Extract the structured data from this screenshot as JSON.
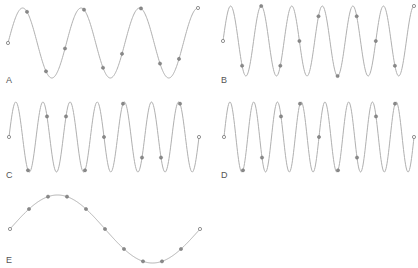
{
  "figure": {
    "colors": {
      "wave": "#b0b0b0",
      "sample": "#8a8a8a",
      "label": "#555555"
    },
    "panels": [
      {
        "label": "A",
        "x0": 8,
        "x1": 198,
        "cy": 43,
        "amp": 35,
        "cycles": 3.25,
        "samples": 11,
        "label_x": 6,
        "label_y": 83
      },
      {
        "label": "B",
        "x0": 223,
        "x1": 414,
        "cy": 41,
        "amp": 35,
        "cycles": 6.25,
        "samples": 11,
        "label_x": 221,
        "label_y": 83
      },
      {
        "label": "C",
        "x0": 9,
        "x1": 199,
        "cy": 137,
        "amp": 35,
        "cycles": 7.0,
        "samples": 11,
        "label_x": 6,
        "label_y": 178
      },
      {
        "label": "D",
        "x0": 224,
        "x1": 414,
        "cy": 137,
        "amp": 35,
        "cycles": 8.0,
        "samples": 11,
        "label_x": 221,
        "label_y": 178
      },
      {
        "label": "E",
        "x0": 10,
        "x1": 200,
        "cy": 229,
        "amp": 34,
        "cycles": 1.0,
        "samples": 11,
        "label_x": 6,
        "label_y": 263
      }
    ]
  }
}
